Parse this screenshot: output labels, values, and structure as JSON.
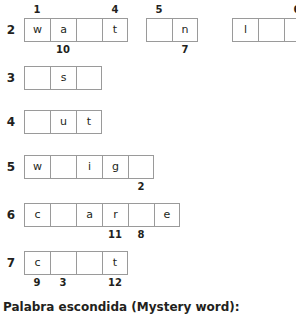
{
  "puzzle": {
    "cell_border_color": "#9a9a9a",
    "text_color": "#231f20",
    "rows": [
      {
        "number": "2",
        "top": 18,
        "groups": [
          {
            "left": 24,
            "clipped": false,
            "letters": [
              "w",
              "a",
              "",
              "t"
            ],
            "labels_above": [
              {
                "text": "1",
                "cell": 0
              },
              {
                "text": "4",
                "cell": 3
              }
            ],
            "labels_below": [
              {
                "text": "10",
                "cell": 1
              }
            ]
          },
          {
            "left": 146,
            "clipped": false,
            "letters": [
              "",
              "n"
            ],
            "labels_above": [
              {
                "text": "5",
                "cell": 0
              }
            ],
            "labels_below": [
              {
                "text": "7",
                "cell": 1
              }
            ]
          },
          {
            "left": 232,
            "clipped": true,
            "letters": [
              "l",
              "",
              ""
            ],
            "labels_above": [
              {
                "text": "6",
                "cell": 2
              }
            ],
            "labels_below": []
          }
        ]
      },
      {
        "number": "3",
        "top": 66,
        "groups": [
          {
            "left": 24,
            "clipped": false,
            "letters": [
              "",
              "s",
              ""
            ],
            "labels_above": [],
            "labels_below": []
          }
        ]
      },
      {
        "number": "4",
        "top": 110,
        "groups": [
          {
            "left": 24,
            "clipped": false,
            "letters": [
              "",
              "u",
              "t"
            ],
            "labels_above": [],
            "labels_below": []
          }
        ]
      },
      {
        "number": "5",
        "top": 155,
        "groups": [
          {
            "left": 24,
            "clipped": false,
            "letters": [
              "w",
              "",
              "i",
              "g",
              ""
            ],
            "labels_above": [],
            "labels_below": [
              {
                "text": "2",
                "cell": 4
              }
            ]
          }
        ]
      },
      {
        "number": "6",
        "top": 203,
        "groups": [
          {
            "left": 24,
            "clipped": false,
            "letters": [
              "c",
              "",
              "a",
              "r",
              "",
              "e"
            ],
            "labels_above": [],
            "labels_below": [
              {
                "text": "11",
                "cell": 3
              },
              {
                "text": "8",
                "cell": 4
              }
            ]
          }
        ]
      },
      {
        "number": "7",
        "top": 251,
        "groups": [
          {
            "left": 24,
            "clipped": false,
            "letters": [
              "c",
              "",
              "",
              "t"
            ],
            "labels_above": [],
            "labels_below": [
              {
                "text": "9",
                "cell": 0
              },
              {
                "text": "3",
                "cell": 1
              },
              {
                "text": "12",
                "cell": 3
              }
            ]
          }
        ]
      }
    ]
  },
  "footer": {
    "mystery_label": "Palabra escondida (Mystery word):"
  }
}
